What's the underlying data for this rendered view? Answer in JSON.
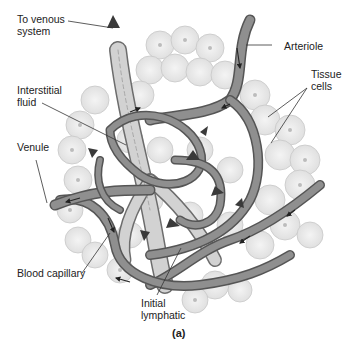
{
  "figure": {
    "caption": "(a)",
    "colors": {
      "background": "#ffffff",
      "cell_fill": "#ebebeb",
      "cell_stroke": "#c4c4c4",
      "cell_nucleus": "#bdbdbd",
      "vessel_fill": "#8e8e8e",
      "vessel_stroke": "#5a5a5a",
      "lymphatic_fill": "#cfcfcf",
      "arrow_dark": "#3a3a3a",
      "label_text": "#222222",
      "leader_line": "#333333"
    },
    "labels": [
      {
        "id": "to-venous-system",
        "text": "To venous\nsystem"
      },
      {
        "id": "arteriole",
        "text": "Arteriole"
      },
      {
        "id": "interstitial-fluid",
        "text": "Interstitial\nfluid"
      },
      {
        "id": "tissue-cells",
        "text": "Tissue\ncells"
      },
      {
        "id": "venule",
        "text": "Venule"
      },
      {
        "id": "blood-capillary",
        "text": "Blood capillary"
      },
      {
        "id": "initial-lymphatic",
        "text": "Initial\nlymphatic"
      }
    ]
  }
}
